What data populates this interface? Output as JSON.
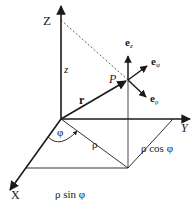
{
  "diagram": {
    "axes": {
      "z_label": "Z",
      "y_label": "Y",
      "x_label": "X"
    },
    "labels": {
      "z_height": "z",
      "point": "P",
      "position_vector": "r",
      "angle": "φ",
      "radial": "ρ",
      "y_component": "ρ cos φ",
      "x_component": "ρ sin φ"
    },
    "unit_vectors": {
      "e_z": "e",
      "e_z_sub": "z",
      "e_phi": "e",
      "e_phi_sub": "φ",
      "e_rho": "e",
      "e_rho_sub": "ρ"
    },
    "colors": {
      "ink": "#1a1a1a",
      "background": "#ffffff"
    }
  }
}
